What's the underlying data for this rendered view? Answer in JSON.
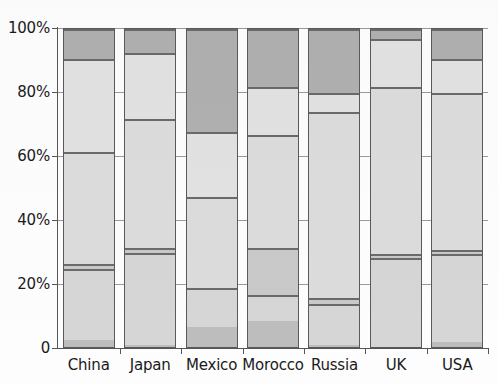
{
  "chart_data": {
    "type": "bar",
    "subtype": "stacked-percentage",
    "title": "",
    "subtitle": "",
    "xlabel": "",
    "ylabel": "",
    "ylim": [
      0,
      100
    ],
    "yticks": [
      0,
      20,
      40,
      60,
      80,
      100
    ],
    "ytick_labels": [
      "0",
      "20%",
      "40%",
      "60%",
      "80%",
      "100%"
    ],
    "grid": true,
    "grid_axis": "y",
    "legend": false,
    "legend_position": "none",
    "units": "percent",
    "categories": [
      "China",
      "Japan",
      "Mexico",
      "Morocco",
      "Russia",
      "UK",
      "USA"
    ],
    "series": [
      {
        "name": "Segment 1",
        "order": 1,
        "stack_position": "bottom",
        "color": "#bdbdbd",
        "values": [
          2.8,
          1.2,
          7.0,
          8.7,
          1.2,
          0.6,
          2.2
        ]
      },
      {
        "name": "Segment 2",
        "order": 2,
        "color": "#d6d6d6",
        "values": [
          22.2,
          28.8,
          12.2,
          8.3,
          12.8,
          27.8,
          27.5
        ]
      },
      {
        "name": "Segment 3",
        "order": 3,
        "color": "#c9c9c9",
        "values": [
          1.5,
          1.5,
          0.0,
          14.5,
          2.0,
          1.3,
          1.3
        ]
      },
      {
        "name": "Segment 4",
        "order": 4,
        "color": "#dcdcdc",
        "values": [
          35.0,
          40.5,
          28.2,
          35.5,
          58.0,
          52.3,
          49.0
        ]
      },
      {
        "name": "Segment 5",
        "order": 5,
        "color": "#e2e2e2",
        "values": [
          29.0,
          20.5,
          20.5,
          15.0,
          6.0,
          15.0,
          10.6
        ]
      },
      {
        "name": "Segment 6",
        "order": 6,
        "stack_position": "top",
        "color": "#b0b0b0",
        "values": [
          9.5,
          7.5,
          32.1,
          18.0,
          20.0,
          3.0,
          9.4
        ]
      }
    ],
    "bar_boundaries_percent": {
      "China": [
        0,
        2.8,
        25.0,
        26.5,
        61.5,
        90.5,
        100
      ],
      "Japan": [
        0,
        1.2,
        30.0,
        31.5,
        72.0,
        92.5,
        100
      ],
      "Mexico": [
        0,
        7.0,
        19.2,
        19.2,
        47.4,
        67.9,
        100
      ],
      "Morocco": [
        0,
        8.7,
        17.0,
        31.5,
        67.0,
        82.0,
        100
      ],
      "Russia": [
        0,
        1.2,
        14.0,
        16.0,
        74.0,
        80.0,
        100
      ],
      "UK": [
        0,
        0.6,
        28.4,
        29.7,
        82.0,
        97.0,
        100
      ],
      "USA": [
        0,
        2.2,
        29.7,
        31.0,
        80.0,
        90.6,
        100
      ]
    }
  },
  "axes": {
    "y": {
      "ticks": [
        {
          "value": 100,
          "label": "100%"
        },
        {
          "value": 80,
          "label": "80%"
        },
        {
          "value": 60,
          "label": "60%"
        },
        {
          "value": 40,
          "label": "40%"
        },
        {
          "value": 20,
          "label": "20%"
        },
        {
          "value": 0,
          "label": "0"
        }
      ]
    },
    "x": {
      "ticks": [
        {
          "label": "China"
        },
        {
          "label": "Japan"
        },
        {
          "label": "Mexico"
        },
        {
          "label": "Morocco"
        },
        {
          "label": "Russia"
        },
        {
          "label": "UK"
        },
        {
          "label": "USA"
        }
      ]
    }
  },
  "style": {
    "axis_color": "#555555",
    "gridline_color": "#9a9a9a",
    "segment_border_color": "#5a5a5a",
    "background": "#fdfdfd",
    "text_color": "#1a1a1a"
  }
}
